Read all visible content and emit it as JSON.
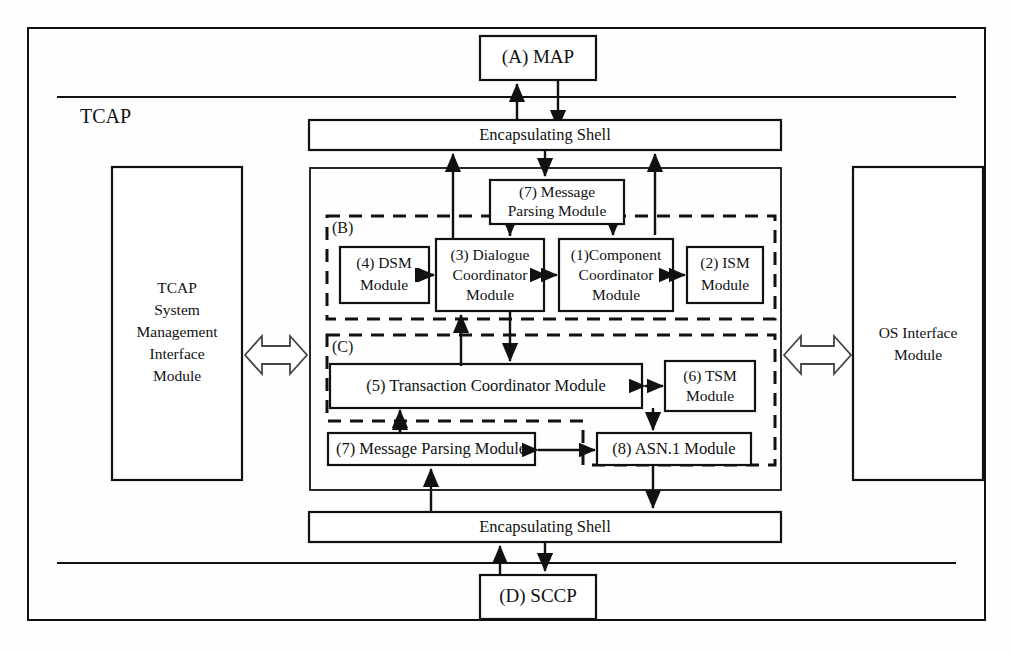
{
  "diagram": {
    "title": "TCAP",
    "outer_label": "TCAP",
    "external_blocks": [
      {
        "id": "map",
        "label": "(A) MAP",
        "x": 480,
        "y": 36,
        "w": 116,
        "h": 44
      },
      {
        "id": "sccp",
        "label": "(D) SCCP",
        "x": 480,
        "y": 575,
        "w": 116,
        "h": 44
      }
    ],
    "shells": [
      {
        "id": "shell-top",
        "label": "Encapsulating Shell",
        "x": 309,
        "y": 120,
        "w": 472,
        "h": 30
      },
      {
        "id": "shell-bottom",
        "label": "Encapsulating Shell",
        "x": 309,
        "y": 512,
        "w": 472,
        "h": 30
      }
    ],
    "side_blocks": [
      {
        "id": "tcap-sysmgmt",
        "lines": [
          "TCAP",
          "System",
          "Management",
          "Interface",
          "Module"
        ],
        "x": 112,
        "y": 167,
        "w": 130,
        "h": 313
      },
      {
        "id": "os-interface",
        "lines": [
          "OS Interface",
          "Module"
        ],
        "x": 853,
        "y": 167,
        "w": 130,
        "h": 313
      }
    ],
    "inner_container": {
      "x": 310,
      "y": 168,
      "w": 471,
      "h": 322
    },
    "regions": [
      {
        "id": "region-b",
        "tag": "(B)",
        "x": 327,
        "y": 216,
        "w": 448,
        "h": 103
      },
      {
        "id": "region-c",
        "tag": "(C)",
        "x": 327,
        "y": 335,
        "w": 448,
        "h": 130
      }
    ],
    "modules": [
      {
        "id": "msg-parsing-top",
        "lines": [
          "(7) Message",
          "Parsing Module"
        ],
        "x": 490,
        "y": 180,
        "w": 134,
        "h": 44
      },
      {
        "id": "dsm",
        "lines": [
          "(4) DSM",
          "Module"
        ],
        "x": 340,
        "y": 247,
        "w": 89,
        "h": 56
      },
      {
        "id": "dialogue-coordinator",
        "lines": [
          "(3) Dialogue",
          "Coordinator",
          "Module"
        ],
        "x": 436,
        "y": 239,
        "w": 108,
        "h": 72
      },
      {
        "id": "component-coordinator",
        "lines": [
          "(1)Component",
          "Coordinator",
          "Module"
        ],
        "x": 559,
        "y": 239,
        "w": 114,
        "h": 72
      },
      {
        "id": "ism",
        "lines": [
          "(2) ISM",
          "Module"
        ],
        "x": 687,
        "y": 247,
        "w": 76,
        "h": 56
      },
      {
        "id": "transaction-coordinator",
        "lines": [
          "(5) Transaction Coordinator Module"
        ],
        "x": 330,
        "y": 364,
        "w": 312,
        "h": 44
      },
      {
        "id": "tsm",
        "lines": [
          "(6) TSM",
          "Module"
        ],
        "x": 665,
        "y": 361,
        "w": 90,
        "h": 50
      },
      {
        "id": "msg-parsing-bottom",
        "lines": [
          "(7) Message Parsing Module"
        ],
        "x": 328,
        "y": 433,
        "w": 207,
        "h": 32
      },
      {
        "id": "asn1",
        "lines": [
          "(8) ASN.1 Module"
        ],
        "x": 597,
        "y": 433,
        "w": 154,
        "h": 32
      }
    ],
    "bidirectional_wide_arrows": [
      {
        "id": "arrow-left-sysmgmt",
        "x1": 244,
        "x2": 308,
        "y": 355
      },
      {
        "id": "arrow-right-osif",
        "x1": 783,
        "x2": 851,
        "y": 355
      }
    ],
    "horizontal_dividers": [
      {
        "id": "divider-top",
        "x1": 57,
        "x2": 956,
        "y": 97
      },
      {
        "id": "divider-bottom",
        "x1": 57,
        "x2": 956,
        "y": 563
      }
    ],
    "outer_frame": {
      "x": 28,
      "y": 28,
      "w": 957,
      "h": 592
    }
  },
  "colors": {
    "stroke": "#111111",
    "background": "#ffffff",
    "hollow_arrow_fill": "#ffffff"
  }
}
